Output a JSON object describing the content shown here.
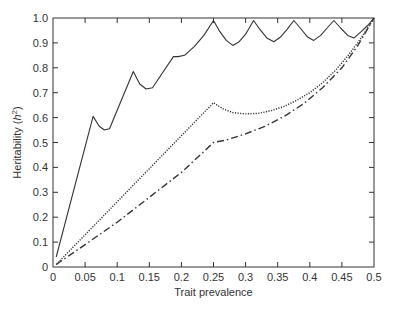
{
  "chart_data": {
    "type": "line",
    "title": "",
    "xlabel": "Trait prevalence",
    "ylabel": "Heritability (h²)",
    "ylabel_parts": {
      "prefix": "Heritability (",
      "var": "h",
      "sup": "2",
      "suffix": ")"
    },
    "xlim": [
      0,
      0.5
    ],
    "ylim": [
      0,
      1.0
    ],
    "grid": false,
    "legend": null,
    "x_ticks": [
      0,
      0.05,
      0.1,
      0.15,
      0.2,
      0.25,
      0.3,
      0.35,
      0.4,
      0.45,
      0.5
    ],
    "x_tick_labels": [
      "0",
      "0.05",
      "0.1",
      "0.15",
      "0.2",
      "0.25",
      "0.3",
      "0.35",
      "0.4",
      "0.45",
      "0.5"
    ],
    "y_ticks": [
      0,
      0.1,
      0.2,
      0.3,
      0.4,
      0.5,
      0.6,
      0.7,
      0.8,
      0.9,
      1.0
    ],
    "y_tick_labels": [
      "0",
      "0.1",
      "0.2",
      "0.3",
      "0.4",
      "0.5",
      "0.6",
      "0.7",
      "0.8",
      "0.9",
      "1.0"
    ],
    "series": [
      {
        "name": "solid",
        "style": "solid",
        "color": "#333333",
        "points": [
          [
            0.005,
            0.04
          ],
          [
            0.0625,
            0.605
          ],
          [
            0.072,
            0.565
          ],
          [
            0.08,
            0.55
          ],
          [
            0.088,
            0.555
          ],
          [
            0.125,
            0.785
          ],
          [
            0.135,
            0.735
          ],
          [
            0.145,
            0.715
          ],
          [
            0.155,
            0.72
          ],
          [
            0.1875,
            0.845
          ],
          [
            0.195,
            0.845
          ],
          [
            0.205,
            0.85
          ],
          [
            0.22,
            0.885
          ],
          [
            0.235,
            0.93
          ],
          [
            0.25,
            0.99
          ],
          [
            0.26,
            0.945
          ],
          [
            0.27,
            0.91
          ],
          [
            0.28,
            0.89
          ],
          [
            0.29,
            0.905
          ],
          [
            0.3,
            0.935
          ],
          [
            0.3125,
            0.99
          ],
          [
            0.322,
            0.955
          ],
          [
            0.333,
            0.92
          ],
          [
            0.344,
            0.905
          ],
          [
            0.355,
            0.925
          ],
          [
            0.365,
            0.955
          ],
          [
            0.375,
            0.99
          ],
          [
            0.385,
            0.96
          ],
          [
            0.396,
            0.925
          ],
          [
            0.406,
            0.91
          ],
          [
            0.417,
            0.93
          ],
          [
            0.427,
            0.96
          ],
          [
            0.4375,
            0.99
          ],
          [
            0.448,
            0.96
          ],
          [
            0.459,
            0.93
          ],
          [
            0.469,
            0.92
          ],
          [
            0.48,
            0.945
          ],
          [
            0.49,
            0.97
          ],
          [
            0.5,
            1.0
          ]
        ]
      },
      {
        "name": "dotted",
        "style": "dotted",
        "color": "#333333",
        "points": [
          [
            0.005,
            0.01
          ],
          [
            0.25,
            0.66
          ],
          [
            0.265,
            0.635
          ],
          [
            0.28,
            0.62
          ],
          [
            0.3,
            0.615
          ],
          [
            0.32,
            0.617
          ],
          [
            0.34,
            0.628
          ],
          [
            0.36,
            0.645
          ],
          [
            0.38,
            0.67
          ],
          [
            0.4,
            0.7
          ],
          [
            0.42,
            0.74
          ],
          [
            0.44,
            0.79
          ],
          [
            0.46,
            0.85
          ],
          [
            0.48,
            0.92
          ],
          [
            0.5,
            1.0
          ]
        ]
      },
      {
        "name": "dash-dot",
        "style": "dashdot",
        "color": "#333333",
        "points": [
          [
            0.005,
            0.01
          ],
          [
            0.05,
            0.09
          ],
          [
            0.1,
            0.18
          ],
          [
            0.15,
            0.28
          ],
          [
            0.2,
            0.38
          ],
          [
            0.25,
            0.5
          ],
          [
            0.27,
            0.51
          ],
          [
            0.3,
            0.535
          ],
          [
            0.33,
            0.565
          ],
          [
            0.36,
            0.605
          ],
          [
            0.39,
            0.655
          ],
          [
            0.42,
            0.72
          ],
          [
            0.45,
            0.8
          ],
          [
            0.475,
            0.89
          ],
          [
            0.5,
            1.0
          ]
        ]
      }
    ]
  },
  "axes": {
    "xlabel": "Trait prevalence",
    "ylabel_prefix": "Heritability (",
    "ylabel_var": "h",
    "ylabel_sup": "2",
    "ylabel_suffix": ")"
  }
}
